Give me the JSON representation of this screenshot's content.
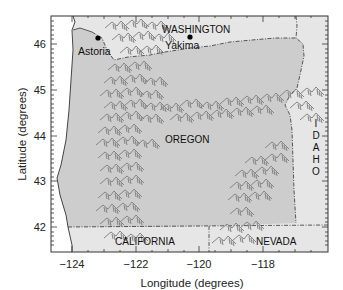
{
  "map": {
    "xlabel": "Longitude (degrees)",
    "ylabel": "Latitude (degrees)",
    "x_ticks": [
      "−124",
      "−122",
      "−120",
      "−118"
    ],
    "y_ticks": [
      "46",
      "45",
      "44",
      "43",
      "42"
    ],
    "x_range": [
      -124.6,
      -116.2
    ],
    "y_range": [
      41.5,
      46.6
    ],
    "colors": {
      "oregon": "#cdcdcd",
      "neighbors": "#e6e6e6",
      "ocean": "#ffffff",
      "mountains": "#858585",
      "border": "#333333"
    },
    "states": {
      "main": "OREGON",
      "north": "WASHINGTON",
      "south_west": "CALIFORNIA",
      "south_east": "NEVADA",
      "east": [
        "I",
        "D",
        "A",
        "H",
        "O"
      ]
    },
    "cities": [
      {
        "name": "Astoria"
      },
      {
        "name": "Yakima"
      }
    ]
  }
}
